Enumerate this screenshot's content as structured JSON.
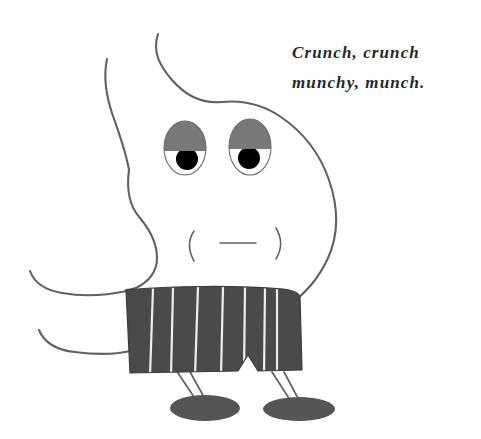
{
  "canvas": {
    "width": 481,
    "height": 439,
    "background_color": "#ffffff",
    "title": "Crunch, crunch munchy, munch."
  },
  "caption": {
    "name": "speech-caption",
    "lines": [
      "Crunch, crunch",
      "munchy, munch."
    ],
    "style": "italic-bold-serif",
    "color": "#23262b"
  },
  "character": {
    "name": "blob-creature",
    "description": "Hand-drawn blob character with droopy eyes, neutral mouth, striped shorts and oval feet",
    "colors": {
      "outline": "#5e6166",
      "eyelid_gray": "#787878",
      "eye_white": "#ffffff",
      "pupil_black": "#000000",
      "shorts_dark": "#4a4a4a",
      "shorts_stripe": "#efefe9",
      "feet_gray": "#555555"
    },
    "parts": {
      "head_label": "head",
      "left_eye_label": "left-eye",
      "right_eye_label": "right-eye",
      "mouth_label": "mouth",
      "shorts_label": "striped-shorts",
      "left_leg_label": "left-leg",
      "right_leg_label": "right-leg",
      "left_foot_label": "left-foot",
      "right_foot_label": "right-foot",
      "upper_arm_label": "upper-arm",
      "lower_arm_label": "lower-arm",
      "antenna_label": "antenna-curl"
    },
    "shorts_stripe_count": 7,
    "mouth_expression": "neutral"
  }
}
